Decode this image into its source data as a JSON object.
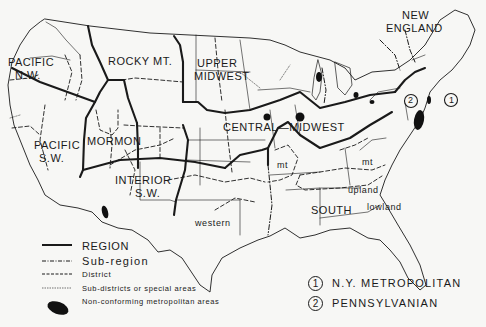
{
  "map": {
    "regions": [
      {
        "id": "pacific-nw",
        "label_line1": "PACIFIC",
        "label_line2": "N.W."
      },
      {
        "id": "rocky-mt",
        "label_line1": "ROCKY MT."
      },
      {
        "id": "upper-midwest",
        "label_line1": "UPPER",
        "label_line2": "MIDWEST"
      },
      {
        "id": "new-england",
        "label_line1": "NEW",
        "label_line2": "ENGLAND"
      },
      {
        "id": "pacific-sw",
        "label_line1": "PACIFIC",
        "label_line2": "S.W."
      },
      {
        "id": "mormon",
        "label_line1": "MORMON"
      },
      {
        "id": "central-midwest",
        "label_line1": "CENTRAL",
        "label_line2": "MIDWEST"
      },
      {
        "id": "interior-sw",
        "label_line1": "INTERIOR",
        "label_line2": "S.W."
      },
      {
        "id": "south",
        "label_line1": "SOUTH"
      }
    ],
    "sub_regions": {
      "western": "western",
      "mt_west": "mt",
      "mt_east": "mt",
      "upland": "upland",
      "lowland": "lowland"
    },
    "circle_markers": [
      {
        "number": "1"
      },
      {
        "number": "2"
      }
    ]
  },
  "legend": {
    "items": [
      {
        "style": "solid-heavy",
        "label": "REGION"
      },
      {
        "style": "dash-dot",
        "label": "Sub-region"
      },
      {
        "style": "dashed",
        "label": "District"
      },
      {
        "style": "dotted-fine",
        "label": "Sub-districts or special areas"
      },
      {
        "style": "filled-ellipse",
        "label": "Non-conforming metropolitan areas"
      }
    ]
  },
  "metro_legend": {
    "items": [
      {
        "number": "1",
        "label": "N.Y. METROPOLITAN"
      },
      {
        "number": "2",
        "label": "PENNSYLVANIAN"
      }
    ]
  },
  "colors": {
    "ink": "#1a1a1a",
    "paper": "#f7f7f5"
  }
}
